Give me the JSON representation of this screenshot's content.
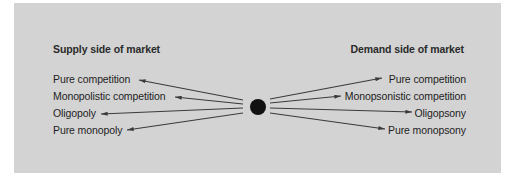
{
  "diagram": {
    "background_color": "#d3d3d3",
    "line_color": "#3a3a3a",
    "dot_color": "#111111",
    "supply": {
      "heading": "Supply side of market",
      "items": [
        {
          "label": "Pure competition"
        },
        {
          "label": "Monopolistic competition"
        },
        {
          "label": "Oligopoly"
        },
        {
          "label": "Pure monopoly"
        }
      ]
    },
    "demand": {
      "heading": "Demand side of market",
      "items": [
        {
          "label": "Pure competition"
        },
        {
          "label": "Monopsonistic competition"
        },
        {
          "label": "Oligopsony"
        },
        {
          "label": "Pure monopsony"
        }
      ]
    },
    "center": {
      "shape": "filled-circle"
    }
  }
}
